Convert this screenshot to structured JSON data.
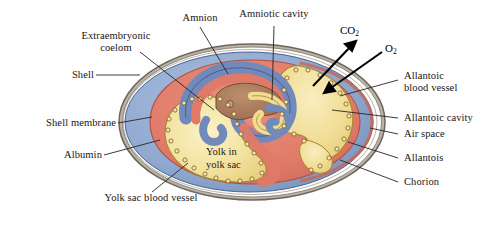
{
  "figure": {
    "kind": "biology-diagram",
    "background_color": "#fefefe"
  },
  "labels": {
    "extraembryonic_coelom": "Extraembryonic\ncoelom",
    "amnion": "Amnion",
    "amniotic_cavity": "Amniotic cavity",
    "shell": "Shell",
    "shell_membrane": "Shell membrane",
    "albumin": "Albumin",
    "yolk_sac_blood_vessel": "Yolk sac blood vessel",
    "yolk_in_yolk_sac": "Yolk in\nyolk sac",
    "allantoic_blood_vessel": "Allantoic\nblood vessel",
    "allantoic_cavity": "Allantoic cavity",
    "air_space": "Air space",
    "allantois": "Allantois",
    "chorion": "Chorion"
  },
  "gases": {
    "carbon_dioxide": "CO",
    "carbon_dioxide_sub": "2",
    "oxygen": "O",
    "oxygen_sub": "2"
  },
  "colors": {
    "shell_outline": "#8a8178",
    "shell_membrane": "#b9b3a8",
    "albumin_blue": "#8fa8cf",
    "chorion_red": "#e08070",
    "yolk_yellow": "#f2e09a",
    "allantoic_yellow": "#f0dc92",
    "embryo_brown": "#a87a5c",
    "amnion_blue": "#7e9ac8",
    "vessel_dot": "#f6e9a8",
    "vessel_dot_edge": "#7a5a2a",
    "label_text": "#1a1514",
    "leader_line": "#2a2420",
    "arrow_black": "#000000",
    "air_space_white": "#fdfdfb"
  },
  "leaders": [
    {
      "name": "extraembryonic-coelom-leader"
    },
    {
      "name": "amnion-leader"
    },
    {
      "name": "amniotic-cavity-leader"
    },
    {
      "name": "shell-leader"
    },
    {
      "name": "shell-membrane-leader"
    },
    {
      "name": "albumin-leader"
    },
    {
      "name": "yolk-sac-blood-vessel-leader"
    },
    {
      "name": "allantoic-blood-vessel-leader"
    },
    {
      "name": "allantoic-cavity-leader"
    },
    {
      "name": "air-space-leader"
    },
    {
      "name": "allantois-leader"
    },
    {
      "name": "chorion-leader"
    }
  ]
}
